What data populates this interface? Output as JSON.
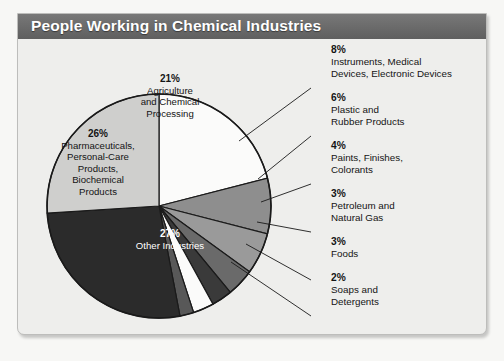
{
  "header": {
    "title": "People Working in Chemical Industries"
  },
  "colors": {
    "header_bar": "#6d6d6d",
    "panel_bg": "#eeeeec",
    "page_bg": "#f7f7f5",
    "outline": "#1a1a1a"
  },
  "chart_data": {
    "type": "pie",
    "title": "People Working in Chemical Industries",
    "xlabel": "",
    "ylabel": "",
    "units": "percent",
    "legend_position": "callouts",
    "grid": false,
    "start_angle_deg": 0,
    "direction": "clockwise",
    "categories": [
      "Agriculture and Chemical Processing",
      "Instruments, Medical Devices, Electronic Devices",
      "Plastic and Rubber Products",
      "Paints, Finishes, Colorants",
      "Petroleum and Natural Gas",
      "Foods",
      "Soaps and Detergents",
      "Other Industries",
      "Pharmaceuticals, Personal-Care Products, Biochemical Products"
    ],
    "values": [
      21,
      8,
      6,
      4,
      3,
      3,
      2,
      27,
      26
    ],
    "slice_colors": [
      "#fbfbfa",
      "#8e8e8e",
      "#9a9a9a",
      "#6a6a6a",
      "#3a3a3a",
      "#fbfbfa",
      "#585858",
      "#2b2b2b",
      "#cfcfcd"
    ],
    "slices": [
      {
        "label": "Agriculture and Chemical Processing",
        "value": 21,
        "percent_text": "21%",
        "color": "#fbfbfa",
        "label_placement": "inside"
      },
      {
        "label": "Instruments, Medical Devices, Electronic Devices",
        "value": 8,
        "percent_text": "8%",
        "color": "#8e8e8e",
        "label_placement": "callout"
      },
      {
        "label": "Plastic and Rubber Products",
        "value": 6,
        "percent_text": "6%",
        "color": "#9a9a9a",
        "label_placement": "callout"
      },
      {
        "label": "Paints, Finishes, Colorants",
        "value": 4,
        "percent_text": "4%",
        "color": "#6a6a6a",
        "label_placement": "callout"
      },
      {
        "label": "Petroleum and Natural Gas",
        "value": 3,
        "percent_text": "3%",
        "color": "#3a3a3a",
        "label_placement": "callout"
      },
      {
        "label": "Foods",
        "value": 3,
        "percent_text": "3%",
        "color": "#fbfbfa",
        "label_placement": "callout"
      },
      {
        "label": "Soaps and Detergents",
        "value": 2,
        "percent_text": "2%",
        "color": "#585858",
        "label_placement": "callout"
      },
      {
        "label": "Other Industries",
        "value": 27,
        "percent_text": "27%",
        "color": "#2b2b2b",
        "label_placement": "inside"
      },
      {
        "label": "Pharmaceuticals, Personal-Care Products, Biochemical Products",
        "value": 26,
        "percent_text": "26%",
        "color": "#cfcfcd",
        "label_placement": "inside"
      }
    ]
  },
  "pie_labels": {
    "agriculture": {
      "pct": "21%",
      "line1": "Agriculture",
      "line2": "and Chemical",
      "line3": "Processing"
    },
    "pharmaceuticals": {
      "pct": "26%",
      "line1": "Pharmaceuticals,",
      "line2": "Personal-Care",
      "line3": "Products,",
      "line4": "Biochemical",
      "line5": "Products"
    },
    "other": {
      "pct": "27%",
      "line1": "Other Industries"
    }
  },
  "callouts": {
    "instruments": {
      "pct": "8%",
      "line1": "Instruments, Medical",
      "line2": "Devices, Electronic Devices"
    },
    "plastic": {
      "pct": "6%",
      "line1": "Plastic and",
      "line2": "Rubber Products"
    },
    "paints": {
      "pct": "4%",
      "line1": "Paints, Finishes,",
      "line2": "Colorants"
    },
    "petroleum": {
      "pct": "3%",
      "line1": "Petroleum and",
      "line2": "Natural Gas"
    },
    "foods": {
      "pct": "3%",
      "line1": "Foods"
    },
    "soaps": {
      "pct": "2%",
      "line1": "Soaps and",
      "line2": "Detergents"
    }
  }
}
